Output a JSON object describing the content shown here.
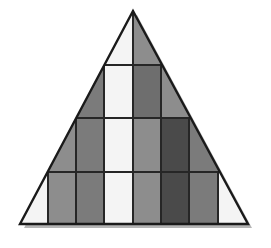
{
  "figure": {
    "background_color": "#ffffff",
    "canvas": {
      "width": 271,
      "height": 248
    },
    "outline": {
      "stroke_color": "#1a1a1a",
      "stroke_width": 2.4,
      "apex": {
        "x": 133,
        "y": 11
      },
      "bottom_left": {
        "x": 20,
        "y": 224
      },
      "bottom_right": {
        "x": 248,
        "y": 224
      }
    },
    "shadow": {
      "color": "#b5b5b5",
      "offset_x": 4,
      "offset_y": 4
    },
    "grid": {
      "stroke_color": "#262626",
      "stroke_width": 2.0,
      "row_boundaries_y": [
        11,
        65,
        118,
        172,
        224
      ],
      "column_boundaries_x": [
        20,
        48,
        76,
        104,
        133,
        161,
        189,
        218,
        248
      ],
      "row_count": 4,
      "column_count": 8
    },
    "palette": {
      "white": "#f4f4f4",
      "gray_light": "#8d8d8d",
      "gray_medium": "#7b7b7b",
      "gray_dark": "#6e6e6e",
      "charcoal": "#4a4a4a"
    },
    "rows": [
      {
        "index": 1,
        "label": "row-1-apex",
        "top": 11,
        "bottom": 65,
        "cells": [
          {
            "id": "r1c4",
            "shade": "white",
            "fill": "#f4f4f4",
            "left": 104,
            "right": 133
          },
          {
            "id": "r1c5",
            "shade": "gray_light",
            "fill": "#8d8d8d",
            "left": 133,
            "right": 161
          }
        ]
      },
      {
        "index": 2,
        "label": "row-2",
        "top": 65,
        "bottom": 118,
        "cells": [
          {
            "id": "r2c3",
            "shade": "gray_medium",
            "fill": "#7b7b7b",
            "left": 76,
            "right": 104
          },
          {
            "id": "r2c4",
            "shade": "white",
            "fill": "#f4f4f4",
            "left": 104,
            "right": 133
          },
          {
            "id": "r2c5",
            "shade": "gray_dark",
            "fill": "#6e6e6e",
            "left": 133,
            "right": 161
          },
          {
            "id": "r2c6",
            "shade": "gray_light",
            "fill": "#8d8d8d",
            "left": 161,
            "right": 189
          }
        ]
      },
      {
        "index": 3,
        "label": "row-3",
        "top": 118,
        "bottom": 172,
        "cells": [
          {
            "id": "r3c2",
            "shade": "gray_light",
            "fill": "#8d8d8d",
            "left": 48,
            "right": 76
          },
          {
            "id": "r3c3",
            "shade": "gray_medium",
            "fill": "#7b7b7b",
            "left": 76,
            "right": 104
          },
          {
            "id": "r3c4",
            "shade": "white",
            "fill": "#f4f4f4",
            "left": 104,
            "right": 133
          },
          {
            "id": "r3c5",
            "shade": "gray_light",
            "fill": "#8d8d8d",
            "left": 133,
            "right": 161
          },
          {
            "id": "r3c6",
            "shade": "charcoal",
            "fill": "#4a4a4a",
            "left": 161,
            "right": 189
          },
          {
            "id": "r3c7",
            "shade": "gray_medium",
            "fill": "#7b7b7b",
            "left": 189,
            "right": 218
          }
        ]
      },
      {
        "index": 4,
        "label": "row-4-base",
        "top": 172,
        "bottom": 224,
        "cells": [
          {
            "id": "r4c1",
            "shade": "white",
            "fill": "#f4f4f4",
            "left": 20,
            "right": 48
          },
          {
            "id": "r4c2",
            "shade": "gray_light",
            "fill": "#8d8d8d",
            "left": 48,
            "right": 76
          },
          {
            "id": "r4c3",
            "shade": "gray_medium",
            "fill": "#7b7b7b",
            "left": 76,
            "right": 104
          },
          {
            "id": "r4c4",
            "shade": "white",
            "fill": "#f4f4f4",
            "left": 104,
            "right": 133
          },
          {
            "id": "r4c5",
            "shade": "gray_light",
            "fill": "#8d8d8d",
            "left": 133,
            "right": 161
          },
          {
            "id": "r4c6",
            "shade": "charcoal",
            "fill": "#4a4a4a",
            "left": 161,
            "right": 189
          },
          {
            "id": "r4c7",
            "shade": "gray_medium",
            "fill": "#7b7b7b",
            "left": 189,
            "right": 218
          },
          {
            "id": "r4c8",
            "shade": "white",
            "fill": "#f4f4f4",
            "left": 218,
            "right": 248
          }
        ]
      }
    ]
  }
}
